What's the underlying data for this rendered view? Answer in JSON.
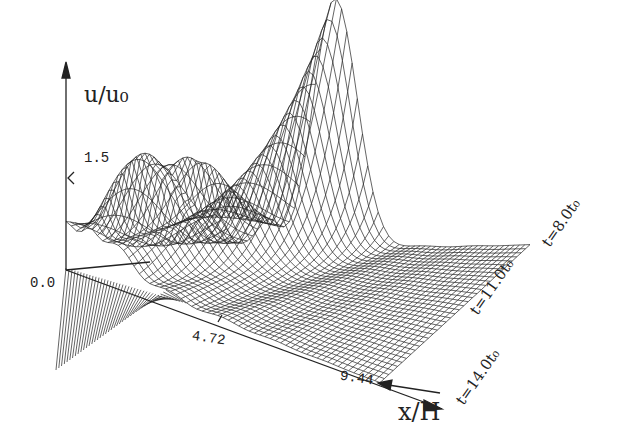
{
  "chart_data": {
    "type": "surface3d-wireframe",
    "title": "",
    "xlabel": "x/H",
    "ylabel": "u/u₀",
    "zlabel": "t",
    "x_ticks": [
      "0.0",
      "4.72",
      "9.44"
    ],
    "x_range": [
      0.0,
      9.44
    ],
    "y_ticks": [
      "0.0",
      "1.5"
    ],
    "t_labels": [
      "t=8.0t₀",
      "t=11.0t₀",
      "t=14.0t₀"
    ],
    "t_range": [
      8.0,
      14.0
    ],
    "peaks": [
      {
        "x": 3.6,
        "t": 8.0,
        "u": 2.6
      },
      {
        "x": 1.4,
        "t": 10.5,
        "u": 1.45
      },
      {
        "x": 0.8,
        "t": 12.0,
        "u": 1.2
      }
    ],
    "grid": false,
    "legend": "none"
  },
  "labels": {
    "y_axis": "u/u₀",
    "x_axis": "x/H",
    "y_tick_top": "1.5",
    "y_tick_zero": "0.0",
    "x_tick_mid": "4.72",
    "x_tick_end": "9.44",
    "t1": "t=8.0t₀",
    "t2": "t=11.0t₀",
    "t3": "t=14.0t₀"
  }
}
